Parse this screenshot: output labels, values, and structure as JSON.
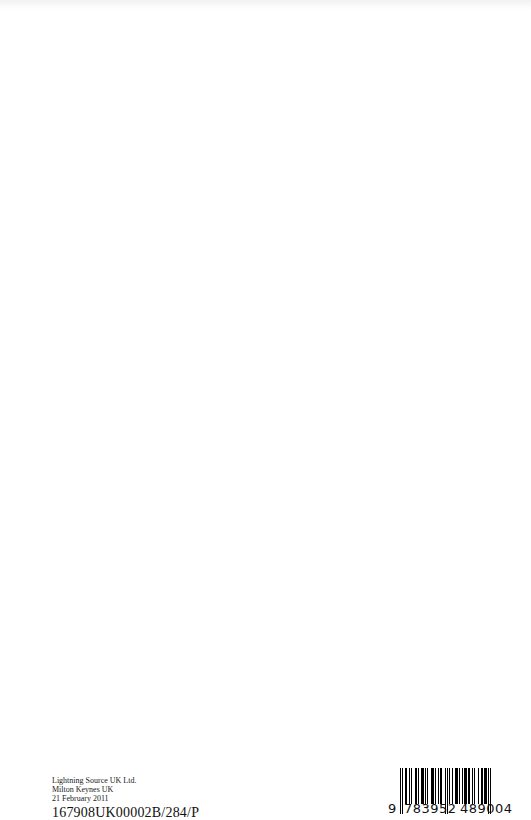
{
  "page": {
    "background": "#ffffff"
  },
  "imprint": {
    "lines": [
      "Lightning Source UK Ltd.",
      "Milton Keynes UK",
      "21 February 2011"
    ],
    "code": "167908UK00002B/284/P"
  },
  "barcode": {
    "icon": "barcode-icon",
    "digits": {
      "lead": "9",
      "left_group": "783952",
      "right_group": "489004"
    }
  }
}
